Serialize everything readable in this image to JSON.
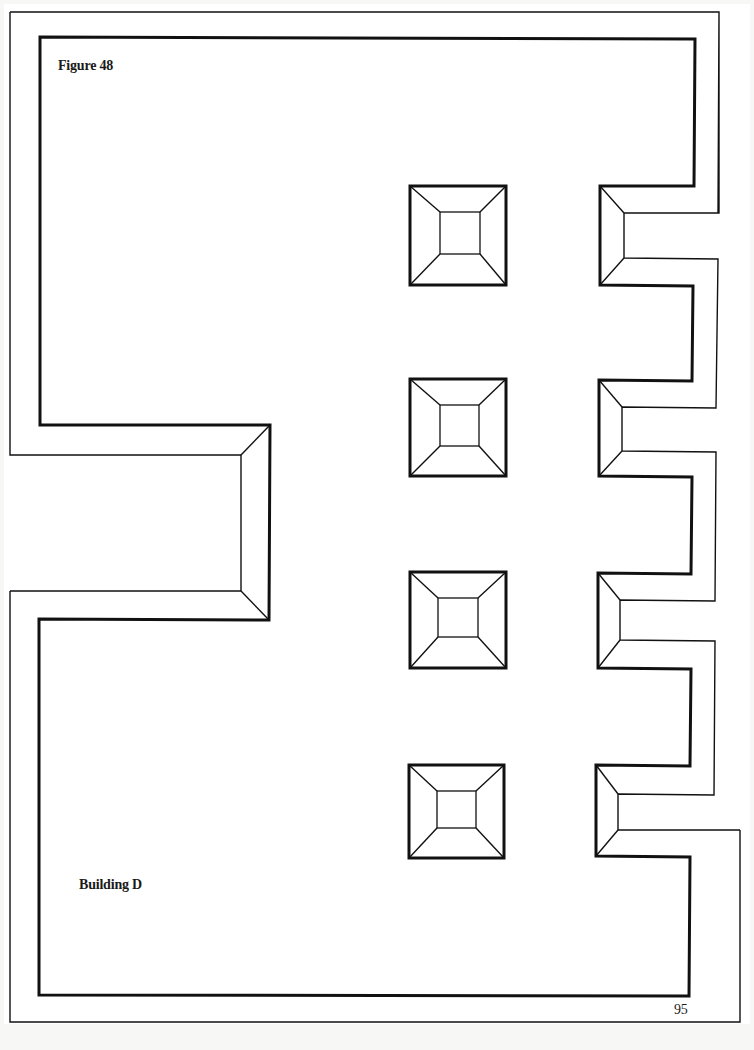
{
  "figure": {
    "title": "Figure 48",
    "building_label": "Building D",
    "page_number": "95"
  },
  "colors": {
    "line": "#111111",
    "paper": "#ffffff",
    "background": "#f7f7f5"
  },
  "pillars": [
    {
      "id": "pillar-1",
      "x": 410,
      "y": 186,
      "w": 96,
      "h": 99
    },
    {
      "id": "pillar-2",
      "x": 410,
      "y": 379,
      "w": 96,
      "h": 97
    },
    {
      "id": "pillar-3",
      "x": 410,
      "y": 572,
      "w": 96,
      "h": 96
    },
    {
      "id": "pillar-4",
      "x": 409,
      "y": 765,
      "w": 95,
      "h": 93
    }
  ],
  "right_notches": [
    {
      "id": "notch-1",
      "top": 186,
      "bottom": 285
    },
    {
      "id": "notch-2",
      "top": 380,
      "bottom": 476
    },
    {
      "id": "notch-3",
      "top": 573,
      "bottom": 668
    },
    {
      "id": "notch-4",
      "top": 765,
      "bottom": 856
    }
  ],
  "left_entrance": {
    "top": 425,
    "bottom": 620,
    "depth": 270
  }
}
